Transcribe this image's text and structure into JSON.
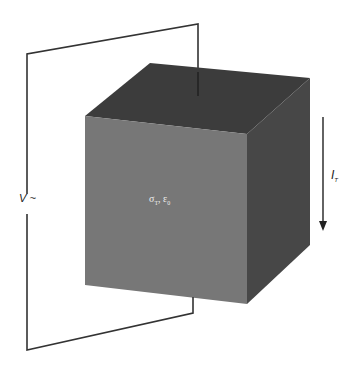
{
  "diagram": {
    "source_label": {
      "symbol": "V",
      "suffix": "~"
    },
    "current_label": {
      "symbol": "I",
      "subscript": "T"
    },
    "material_label": {
      "sigma": "σ",
      "sigma_sub": "T",
      "sep": ", ",
      "eps": "ε",
      "eps_sub": "0"
    },
    "colors": {
      "front_face": "#777777",
      "top_face": "#3c3c3c",
      "right_face": "#474747",
      "wire": "#333333",
      "background": "#ffffff"
    }
  }
}
